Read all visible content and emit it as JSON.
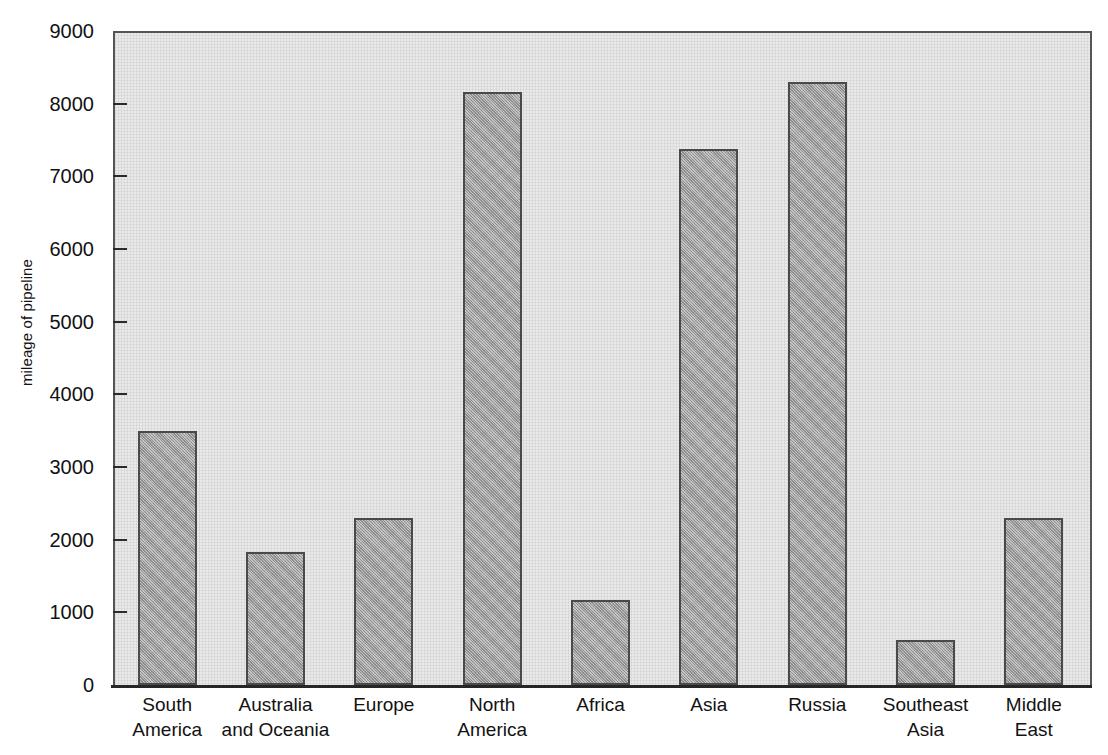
{
  "chart_data": {
    "type": "bar",
    "title": "",
    "subtitle": "",
    "xlabel": "",
    "ylabel": "mileage of pipeline",
    "ylim": [
      0,
      9000
    ],
    "ytick_step": 1000,
    "yticks": [
      "9000",
      "8000",
      "7000",
      "6000",
      "5000",
      "4000",
      "3000",
      "2000",
      "1000",
      "0"
    ],
    "grid": false,
    "legend": false,
    "legend_position": "none",
    "categories": [
      "South America",
      "Australia and Oceania",
      "Europe",
      "North America",
      "Africa",
      "Asia",
      "Russia",
      "Southeast Asia",
      "Middle East"
    ],
    "category_lines": [
      [
        "South",
        "America"
      ],
      [
        "Australia",
        "and Oceania"
      ],
      [
        "Europe",
        ""
      ],
      [
        "North",
        "America"
      ],
      [
        "Africa",
        ""
      ],
      [
        "Asia",
        ""
      ],
      [
        "Russia",
        ""
      ],
      [
        "Southeast",
        "Asia"
      ],
      [
        "Middle",
        "East"
      ]
    ],
    "values": [
      3500,
      1830,
      2300,
      8160,
      1170,
      7380,
      8300,
      620,
      2300
    ],
    "bar_color": "#b3b3b3",
    "bar_edge_color": "#4a4a4a",
    "plot_background": "#e9e9e9",
    "axis_color": "#262626",
    "text_color": "#121212"
  }
}
